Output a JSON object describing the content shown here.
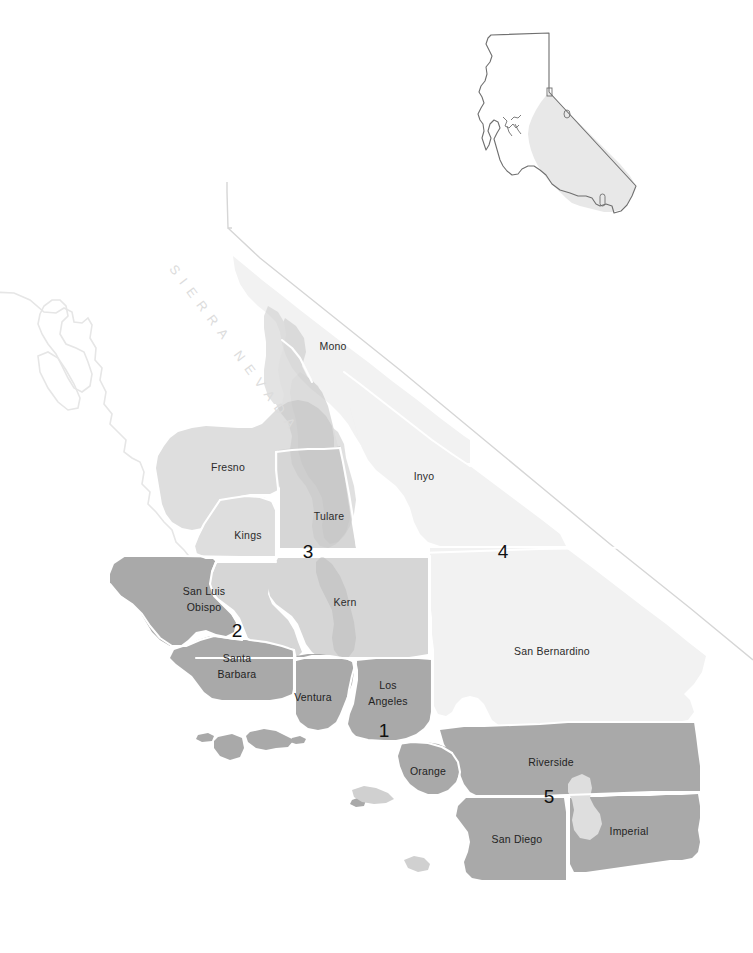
{
  "map": {
    "title": "Southern California counties reference map",
    "background_color": "#ffffff",
    "palette": {
      "very_light": "#f2f2f2",
      "light": "#dedede",
      "light_mid": "#d6d6d6",
      "mid": "#cfcfcf",
      "mid_dark": "#c4c4c4",
      "dark": "#a9a9a9",
      "border_white": "#ffffff",
      "faint_outline": "#e4e4e4",
      "inset_outline": "#6f6f6f",
      "inset_fill": "#e8e8e8",
      "label_text": "#2b2b2b",
      "marker_text": "#111111",
      "range_text": "#dcdcdc"
    },
    "range_label": {
      "text": "SIERRA NEVADA",
      "rotation_deg": 55
    },
    "counties": [
      {
        "name": "Mono",
        "label": "Mono",
        "x": 333,
        "y": 347,
        "shade": "very_light"
      },
      {
        "name": "Inyo",
        "label": "Inyo",
        "x": 424,
        "y": 477,
        "shade": "very_light"
      },
      {
        "name": "Fresno",
        "label": "Fresno",
        "x": 228,
        "y": 468,
        "shade": "light"
      },
      {
        "name": "Tulare",
        "label": "Tulare",
        "x": 329,
        "y": 517,
        "shade": "light_mid"
      },
      {
        "name": "Kings",
        "label": "Kings",
        "x": 248,
        "y": 536,
        "shade": "light"
      },
      {
        "name": "Kern",
        "label": "Kern",
        "x": 345,
        "y": 603,
        "shade": "light_mid"
      },
      {
        "name": "San Luis Obispo",
        "label": "San Luis Obispo",
        "x": 204,
        "y": 599,
        "shade": "dark",
        "two_line": true
      },
      {
        "name": "Santa Barbara",
        "label": "Santa Barbara",
        "x": 237,
        "y": 666,
        "shade": "dark",
        "two_line": true
      },
      {
        "name": "Ventura",
        "label": "Ventura",
        "x": 313,
        "y": 698,
        "shade": "dark"
      },
      {
        "name": "Los Angeles",
        "label": "Los Angeles",
        "x": 388,
        "y": 693,
        "shade": "dark",
        "two_line": true
      },
      {
        "name": "Orange",
        "label": "Orange",
        "x": 428,
        "y": 772,
        "shade": "dark"
      },
      {
        "name": "San Bernardino",
        "label": "San Bernardino",
        "x": 552,
        "y": 652,
        "shade": "very_light"
      },
      {
        "name": "Riverside",
        "label": "Riverside",
        "x": 551,
        "y": 763,
        "shade": "dark"
      },
      {
        "name": "San Diego",
        "label": "San Diego",
        "x": 517,
        "y": 840,
        "shade": "dark"
      },
      {
        "name": "Imperial",
        "label": "Imperial",
        "x": 629,
        "y": 832,
        "shade": "dark"
      }
    ],
    "markers": [
      {
        "id": "1",
        "label": "1",
        "x": 384,
        "y": 732,
        "near": "Los Angeles"
      },
      {
        "id": "2",
        "label": "2",
        "x": 237,
        "y": 632,
        "near": "San Luis Obispo / Santa Barbara"
      },
      {
        "id": "3",
        "label": "3",
        "x": 308,
        "y": 553,
        "near": "Tulare / Kern"
      },
      {
        "id": "4",
        "label": "4",
        "x": 503,
        "y": 553,
        "near": "Inyo / San Bernardino"
      },
      {
        "id": "5",
        "label": "5",
        "x": 549,
        "y": 798,
        "near": "Riverside / San Diego"
      }
    ],
    "inset": {
      "name": "california-state-inset",
      "highlight_region": "southern-california",
      "outline_color": "#6f6f6f",
      "fill_color": "#ffffff",
      "highlight_fill": "#e8e8e8"
    },
    "water_features": [
      {
        "name": "Salton Sea",
        "shade": "light"
      }
    ],
    "islands": [
      "San Miguel Island",
      "Santa Rosa Island",
      "Santa Cruz Island",
      "Anacapa Island",
      "Santa Barbara Island",
      "Santa Catalina Island",
      "San Clemente Island",
      "San Nicolas Island"
    ]
  }
}
